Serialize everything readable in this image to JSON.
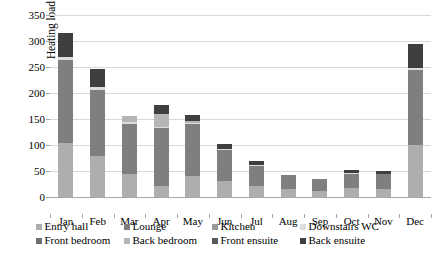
{
  "chart_data": {
    "type": "bar",
    "subtype": "stacked-bar",
    "title": "",
    "xlabel": "",
    "ylabel": "Heating load (kWh)",
    "ylim": [
      0,
      350
    ],
    "ytick_step": 50,
    "yticks": [
      0,
      50,
      100,
      150,
      200,
      250,
      300,
      350
    ],
    "grid": "horizontal",
    "legend_position": "bottom",
    "legend_columns": 4,
    "categories": [
      "Jan",
      "Feb",
      "Mar",
      "Apr",
      "May",
      "Jun",
      "Jul",
      "Aug",
      "Sep",
      "Oct",
      "Nov",
      "Dec"
    ],
    "series": [
      {
        "name": "Entry hall",
        "color": "#aeaeae",
        "values": [
          104,
          79,
          45,
          22,
          40,
          30,
          22,
          15,
          12,
          17,
          15,
          100
        ]
      },
      {
        "name": "Lounge",
        "color": "#7f7f7f",
        "values": [
          160,
          126,
          95,
          110,
          100,
          60,
          38,
          27,
          22,
          28,
          29,
          144
        ]
      },
      {
        "name": "Kitchen",
        "color": "#9a9a9a",
        "values": [
          0,
          0,
          0,
          0,
          0,
          0,
          0,
          0,
          0,
          0,
          0,
          0
        ]
      },
      {
        "name": "Downstairs WC",
        "color": "#dcdcdc",
        "values": [
          6,
          6,
          4,
          3,
          3,
          3,
          2,
          1,
          1,
          1,
          1,
          5
        ]
      },
      {
        "name": "Front bedroom",
        "color": "#6f6f6f",
        "values": [
          0,
          0,
          0,
          0,
          0,
          0,
          0,
          0,
          0,
          0,
          0,
          0
        ]
      },
      {
        "name": "Back bedroom",
        "color": "#b5b5b5",
        "values": [
          0,
          0,
          12,
          24,
          4,
          0,
          0,
          0,
          0,
          0,
          0,
          0
        ]
      },
      {
        "name": "Front ensuite",
        "color": "#5a5a5a",
        "values": [
          0,
          0,
          0,
          0,
          0,
          0,
          0,
          0,
          0,
          0,
          0,
          0
        ]
      },
      {
        "name": "Back ensuite",
        "color": "#3f3f3f",
        "values": [
          46,
          36,
          0,
          18,
          10,
          9,
          8,
          0,
          0,
          6,
          5,
          46
        ]
      }
    ],
    "totals": [
      316,
      247,
      156,
      177,
      157,
      102,
      70,
      43,
      35,
      52,
      50,
      295
    ]
  },
  "legend": {
    "rows": [
      [
        {
          "label": "Entry hall",
          "color": "#aeaeae"
        },
        {
          "label": "Lounge",
          "color": "#7f7f7f"
        },
        {
          "label": "Kitchen",
          "color": "#9a9a9a"
        },
        {
          "label": "Downstairs WC",
          "color": "#dcdcdc"
        }
      ],
      [
        {
          "label": "Front bedroom",
          "color": "#6f6f6f"
        },
        {
          "label": "Back bedroom",
          "color": "#b5b5b5"
        },
        {
          "label": "Front ensuite",
          "color": "#5a5a5a"
        },
        {
          "label": "Back ensuite",
          "color": "#3f3f3f"
        }
      ]
    ]
  }
}
